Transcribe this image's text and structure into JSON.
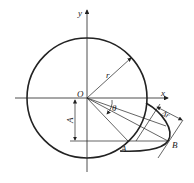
{
  "diagram": {
    "labels": {
      "y_axis": "y",
      "x_axis": "x",
      "origin": "O",
      "radius": "r",
      "angle": "θ",
      "offset": "A",
      "delta_r": "Δr",
      "point_A": "A",
      "point_B": "B"
    },
    "colors": {
      "stroke": "#222222",
      "background": "#ffffff"
    }
  }
}
